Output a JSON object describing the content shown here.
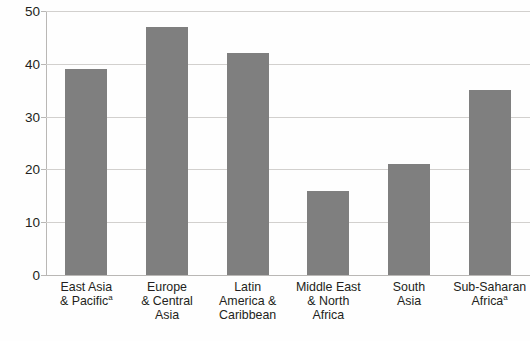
{
  "chart_data": {
    "type": "bar",
    "title": "",
    "xlabel": "",
    "ylabel": "",
    "ylim": [
      0,
      50
    ],
    "yticks": [
      0,
      10,
      20,
      30,
      40,
      50
    ],
    "grid": true,
    "legend": false,
    "bar_color": "#7f7f7f",
    "gridline_color": "#d2d0ce",
    "categories": [
      "East Asia & Pacific",
      "Europe & Central Asia",
      "Latin America & Caribbean",
      "Middle East & North Africa",
      "South Asia",
      "Sub-Saharan Africa"
    ],
    "values": [
      39,
      47,
      42,
      16,
      21,
      35
    ]
  },
  "axis": {
    "y_ticks": [
      {
        "label": "50",
        "value": 50
      },
      {
        "label": "40",
        "value": 40
      },
      {
        "label": "30",
        "value": 30
      },
      {
        "label": "20",
        "value": 20
      },
      {
        "label": "10",
        "value": 10
      },
      {
        "label": "0",
        "value": 0
      }
    ]
  },
  "categories": [
    {
      "lines": [
        "East Asia",
        "& Pacific"
      ],
      "superscript": "a",
      "superscript_line": 1
    },
    {
      "lines": [
        "Europe",
        "& Central",
        "Asia"
      ],
      "superscript": "",
      "superscript_line": -1
    },
    {
      "lines": [
        "Latin",
        "America &",
        "Caribbean"
      ],
      "superscript": "",
      "superscript_line": -1
    },
    {
      "lines": [
        "Middle East",
        "& North",
        "Africa"
      ],
      "superscript": "",
      "superscript_line": -1
    },
    {
      "lines": [
        "South",
        "Asia"
      ],
      "superscript": "",
      "superscript_line": -1
    },
    {
      "lines": [
        "Sub-Saharan",
        "Africa"
      ],
      "superscript": "a",
      "superscript_line": 1
    }
  ],
  "header": {
    "cutoff_text": ""
  }
}
